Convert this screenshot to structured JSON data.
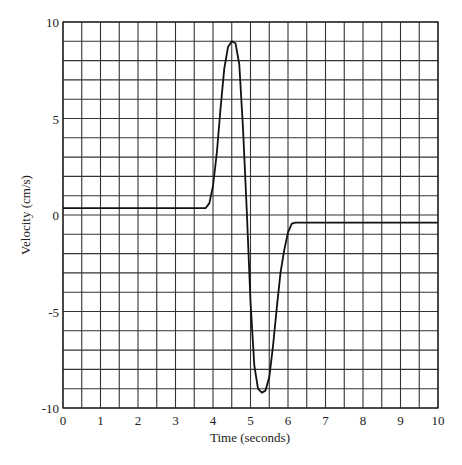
{
  "chart_data": {
    "type": "line",
    "title": "",
    "xlabel": "Time (seconds)",
    "ylabel": "Velocity (cm/s)",
    "xlim": [
      0,
      10
    ],
    "ylim": [
      -10,
      10
    ],
    "x_ticks": [
      "0",
      "1",
      "2",
      "3",
      "4",
      "5",
      "6",
      "7",
      "8",
      "9",
      "10"
    ],
    "y_ticks": [
      "10",
      "5",
      "0",
      "-5",
      "-10"
    ],
    "grid": {
      "on": true,
      "x_step": 0.5,
      "y_step": 1
    },
    "legend": null,
    "series": [
      {
        "name": "velocity",
        "color": "#111111",
        "x": [
          0,
          3.8,
          3.9,
          4.0,
          4.1,
          4.2,
          4.3,
          4.4,
          4.5,
          4.6,
          4.7,
          4.8,
          4.9,
          5.0,
          5.1,
          5.2,
          5.3,
          5.4,
          5.5,
          5.6,
          5.7,
          5.8,
          5.9,
          6.0,
          6.1,
          6.2,
          10
        ],
        "values": [
          0.35,
          0.35,
          0.6,
          1.5,
          3.2,
          5.5,
          7.6,
          8.7,
          9.0,
          8.9,
          7.8,
          4.5,
          0.2,
          -4.5,
          -7.8,
          -9.0,
          -9.2,
          -9.1,
          -8.4,
          -6.8,
          -4.8,
          -3.0,
          -1.8,
          -0.9,
          -0.45,
          -0.4,
          -0.4
        ]
      }
    ]
  }
}
